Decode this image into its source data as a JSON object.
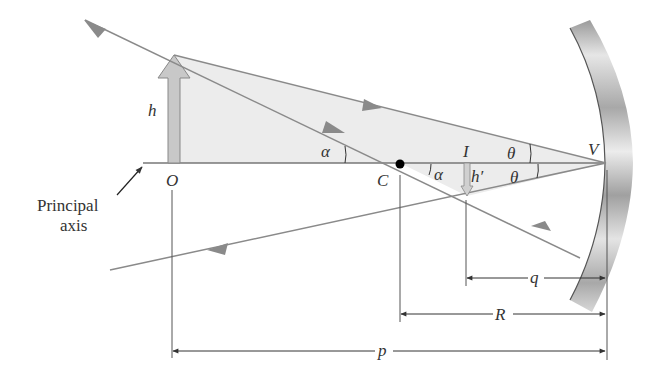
{
  "diagram": {
    "type": "concave-mirror-ray-diagram",
    "labels": {
      "object_height": "h",
      "object_point": "O",
      "center_of_curvature": "C",
      "image_point": "I",
      "image_height": "h′",
      "vertex": "V",
      "angle_alpha_upper": "α",
      "angle_alpha_lower": "α",
      "angle_theta_upper": "θ",
      "angle_theta_lower": "θ",
      "principal_axis_line1": "Principal",
      "principal_axis_line2": "axis",
      "image_distance": "q",
      "radius": "R",
      "object_distance": "p"
    },
    "colors": {
      "ray": "#8a8a8a",
      "shaded_triangle": "#ececec",
      "object_arrow_fill": "#c8c8c8",
      "mirror_light": "#e8e8e8",
      "mirror_dark": "#9a9a9a",
      "line": "#555555",
      "text": "#333333"
    }
  }
}
